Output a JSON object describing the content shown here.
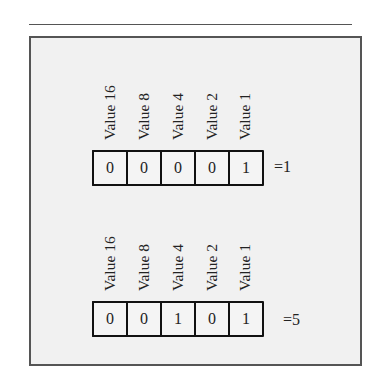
{
  "diagram": {
    "title": "",
    "groups": [
      {
        "labels": [
          "Value 16",
          "Value 8",
          "Value 4",
          "Value 2",
          "Value 1"
        ],
        "bits": [
          "0",
          "0",
          "0",
          "0",
          "1"
        ],
        "result": "=1"
      },
      {
        "labels": [
          "Value 16",
          "Value 8",
          "Value 4",
          "Value 2",
          "Value 1"
        ],
        "bits": [
          "0",
          "0",
          "1",
          "0",
          "1"
        ],
        "result": "=5"
      }
    ]
  },
  "colors": {
    "frame_border": "#555555",
    "frame_fill": "#f1f1f1",
    "cell_border": "#111111"
  }
}
